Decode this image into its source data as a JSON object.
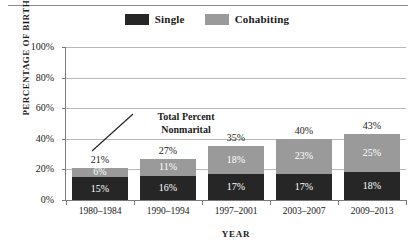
{
  "chart_data": {
    "type": "bar",
    "subtype": "stacked-bar",
    "title": "",
    "xlabel": "YEAR",
    "ylabel": "PERCENTAGE OF BIRTHS",
    "categories": [
      "1980–1984",
      "1990–1994",
      "1997–2001",
      "2003–2007",
      "2009–2013"
    ],
    "series": [
      {
        "name": "Single",
        "color": "#262626",
        "values": [
          15,
          16,
          17,
          17,
          18
        ],
        "labels": [
          "15%",
          "16%",
          "17%",
          "17%",
          "18%"
        ]
      },
      {
        "name": "Cohabiting",
        "color": "#9a9a9a",
        "values": [
          6,
          11,
          18,
          23,
          25
        ],
        "labels": [
          "6%",
          "11%",
          "18%",
          "23%",
          "25%"
        ]
      }
    ],
    "totals": [
      21,
      27,
      35,
      40,
      43
    ],
    "total_labels": [
      "21%",
      "27%",
      "35%",
      "40%",
      "43%"
    ],
    "ylim": [
      0,
      100
    ],
    "yticks": [
      0,
      20,
      40,
      60,
      80,
      100
    ],
    "ytick_labels": [
      "0%",
      "20%",
      "40%",
      "60%",
      "80%",
      "100%"
    ],
    "grid": true,
    "legend_position": "top-center",
    "annotations": [
      {
        "text_line_1": "Total Percent",
        "text_line_2": "Nonmarital",
        "points_to": "21%"
      }
    ]
  },
  "legend": {
    "entries": [
      {
        "label": "Single",
        "color": "#262626"
      },
      {
        "label": "Cohabiting",
        "color": "#9a9a9a"
      }
    ]
  }
}
